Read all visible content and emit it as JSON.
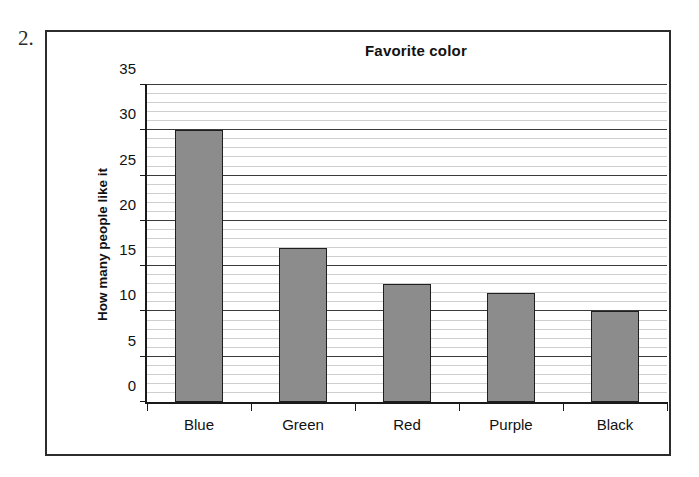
{
  "question_number": "2.",
  "chart_data": {
    "type": "bar",
    "title": "Favorite color",
    "xlabel": "",
    "ylabel": "How many people like it",
    "categories": [
      "Blue",
      "Green",
      "Red",
      "Purple",
      "Black"
    ],
    "values": [
      30,
      17,
      13,
      12,
      10
    ],
    "ylim": [
      0,
      35
    ],
    "ytick_labels": [
      "0",
      "5",
      "10",
      "15",
      "20",
      "25",
      "30",
      "35"
    ],
    "ytick_values": [
      0,
      5,
      10,
      15,
      20,
      25,
      30,
      35
    ],
    "major_gridline_step": 5,
    "minor_gridline_step": 1,
    "grid": true,
    "legend": false,
    "bar_color": "#8c8c8c",
    "bar_border_color": "#1f1f1f",
    "axis_color": "#1a1a1a",
    "major_grid_color": "#3a3a3a",
    "minor_grid_color": "#cfcfcf",
    "frame_color": "#2c2c2c"
  }
}
